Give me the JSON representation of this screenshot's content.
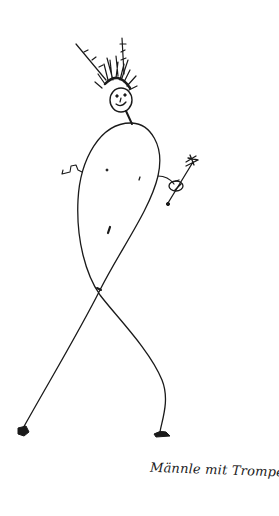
{
  "artwork": {
    "subject": "stick figure with large loop body, spiky hair, holding a trumpet",
    "caption": "Männle mit Trompete.",
    "ink_color": "#1a1a1a",
    "background_color": "#ffffff"
  }
}
